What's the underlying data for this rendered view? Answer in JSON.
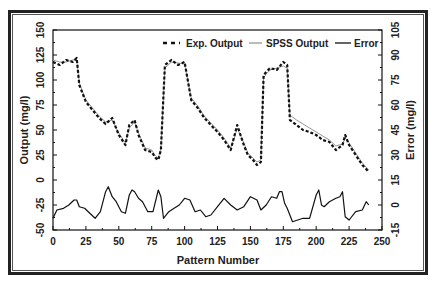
{
  "chart_data": {
    "type": "line",
    "title": "",
    "xlabel": "Pattern Number",
    "ylabel": "Output (mg/l)",
    "y2label": "Error (mg/l)",
    "xlim": [
      0,
      250
    ],
    "ylim": [
      -50,
      150
    ],
    "y2lim": [
      -15,
      105
    ],
    "xticks": [
      "0",
      "25",
      "50",
      "75",
      "100",
      "125",
      "150",
      "175",
      "200",
      "225",
      "250"
    ],
    "yticks": [
      "-50",
      "-25",
      "0",
      "25",
      "50",
      "75",
      "100",
      "125",
      "150"
    ],
    "y2ticks": [
      "-15",
      "0",
      "15",
      "30",
      "45",
      "60",
      "75",
      "90",
      "105"
    ],
    "grid": false,
    "legend_position": "top-right inside",
    "legend": [
      "Exp. Output",
      "SPSS Output",
      "Error"
    ],
    "series": [
      {
        "name": "Exp. Output",
        "axis": "left",
        "style": "dashed-black",
        "x": [
          0,
          5,
          10,
          15,
          18,
          20,
          25,
          30,
          35,
          40,
          45,
          50,
          55,
          58,
          62,
          65,
          70,
          75,
          78,
          80,
          82,
          85,
          90,
          95,
          100,
          105,
          110,
          115,
          120,
          125,
          130,
          135,
          138,
          140,
          145,
          148,
          152,
          155,
          158,
          160,
          162,
          165,
          170,
          175,
          178,
          180,
          185,
          190,
          195,
          200,
          205,
          210,
          215,
          220,
          222,
          225,
          230,
          235,
          240
        ],
        "values": [
          118,
          115,
          120,
          118,
          122,
          95,
          78,
          70,
          62,
          56,
          62,
          45,
          35,
          55,
          60,
          45,
          30,
          28,
          22,
          20,
          30,
          115,
          120,
          115,
          118,
          80,
          72,
          62,
          55,
          48,
          40,
          30,
          45,
          55,
          35,
          25,
          20,
          15,
          18,
          105,
          108,
          112,
          110,
          118,
          115,
          60,
          55,
          50,
          48,
          45,
          40,
          38,
          30,
          35,
          45,
          35,
          25,
          15,
          8
        ]
      },
      {
        "name": "SPSS Output",
        "axis": "left",
        "style": "thin-gray",
        "x": [
          0,
          5,
          10,
          15,
          18,
          20,
          25,
          30,
          35,
          40,
          45,
          50,
          55,
          58,
          62,
          65,
          70,
          75,
          78,
          80,
          82,
          85,
          90,
          95,
          100,
          105,
          110,
          115,
          120,
          125,
          130,
          135,
          138,
          140,
          145,
          148,
          152,
          155,
          158,
          160,
          162,
          165,
          170,
          175,
          178,
          180,
          185,
          190,
          195,
          200,
          205,
          210,
          215,
          220,
          222,
          225,
          230,
          235,
          240
        ],
        "values": [
          120,
          118,
          118,
          120,
          120,
          97,
          80,
          72,
          64,
          58,
          60,
          47,
          37,
          52,
          58,
          47,
          32,
          30,
          24,
          22,
          32,
          112,
          118,
          117,
          116,
          82,
          74,
          64,
          57,
          50,
          42,
          32,
          43,
          52,
          37,
          27,
          22,
          18,
          20,
          102,
          106,
          110,
          112,
          114,
          112,
          65,
          60,
          56,
          52,
          48,
          44,
          40,
          34,
          36,
          42,
          37,
          27,
          17,
          10
        ]
      },
      {
        "name": "Error",
        "axis": "right",
        "style": "solid-black",
        "x": [
          0,
          3,
          8,
          12,
          16,
          18,
          20,
          24,
          28,
          32,
          36,
          40,
          42,
          45,
          48,
          52,
          55,
          58,
          60,
          62,
          65,
          68,
          72,
          76,
          80,
          82,
          84,
          88,
          92,
          96,
          100,
          104,
          108,
          112,
          116,
          120,
          125,
          130,
          135,
          140,
          145,
          150,
          155,
          158,
          162,
          166,
          170,
          172,
          174,
          176,
          178,
          182,
          186,
          190,
          195,
          200,
          202,
          204,
          206,
          210,
          215,
          218,
          220,
          222,
          225,
          230,
          235,
          238,
          240
        ],
        "values": [
          -8,
          -3,
          -2,
          0,
          3,
          3,
          -1,
          -2,
          -5,
          -8,
          -4,
          8,
          11,
          5,
          2,
          -4,
          -5,
          6,
          9,
          8,
          4,
          2,
          -4,
          -4,
          9,
          5,
          -8,
          -4,
          -2,
          0,
          4,
          3,
          -4,
          -3,
          -7,
          -6,
          -1,
          4,
          0,
          -3,
          -1,
          5,
          3,
          -3,
          0,
          5,
          4,
          8,
          8,
          1,
          -2,
          -10,
          -9,
          -8,
          -8,
          6,
          9,
          0,
          -1,
          2,
          4,
          5,
          8,
          -7,
          -9,
          -4,
          -3,
          2,
          0
        ]
      }
    ]
  },
  "legend": {
    "items": [
      {
        "label": "Exp. Output"
      },
      {
        "label": "SPSS Output"
      },
      {
        "label": "Error"
      }
    ]
  },
  "axes": {
    "x_title": "Pattern Number",
    "y_left_title": "Output (mg/l)",
    "y_right_title": "Error (mg/l)"
  }
}
